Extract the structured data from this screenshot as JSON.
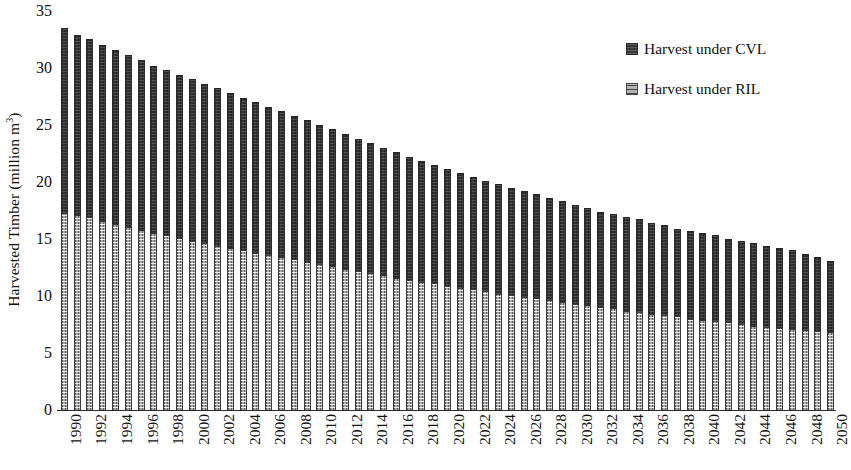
{
  "chart_data": {
    "type": "bar",
    "title": "",
    "subtitle": "",
    "xlabel": "",
    "ylabel": "Harvested Timber (million m³)",
    "ylabel_plain": "Harvested Timber (million m3)",
    "ylim": [
      0,
      35
    ],
    "ytick_step": 5,
    "yticks": [
      0,
      5,
      10,
      15,
      20,
      25,
      30,
      35
    ],
    "grid": false,
    "legend_position": "top-right",
    "bar_style": "overlapping (RIL drawn in front of CVL, same x position)",
    "x": [
      1990,
      1991,
      1992,
      1993,
      1994,
      1995,
      1996,
      1997,
      1998,
      1999,
      2000,
      2001,
      2002,
      2003,
      2004,
      2005,
      2006,
      2007,
      2008,
      2009,
      2010,
      2011,
      2012,
      2013,
      2014,
      2015,
      2016,
      2017,
      2018,
      2019,
      2020,
      2021,
      2022,
      2023,
      2024,
      2025,
      2026,
      2027,
      2028,
      2029,
      2030,
      2031,
      2032,
      2033,
      2034,
      2035,
      2036,
      2037,
      2038,
      2039,
      2040,
      2041,
      2042,
      2043,
      2044,
      2045,
      2046,
      2047,
      2048,
      2049,
      2050
    ],
    "xtick_labels": [
      "1990",
      "1992",
      "1994",
      "1996",
      "1998",
      "2000",
      "2002",
      "2004",
      "2006",
      "2008",
      "2010",
      "2012",
      "2014",
      "2016",
      "2018",
      "2020",
      "2022",
      "2024",
      "2026",
      "2028",
      "2030",
      "2032",
      "2034",
      "2036",
      "2038",
      "2040",
      "2042",
      "2044",
      "2046",
      "2048",
      "2050"
    ],
    "xtick_label_rotation_deg": 90,
    "xtick_label_interval_years": 2,
    "series": [
      {
        "name": "Harvest under CVL",
        "color": "#343434",
        "values": [
          33.6,
          33.0,
          32.6,
          32.1,
          31.7,
          31.2,
          30.8,
          30.3,
          29.9,
          29.5,
          29.1,
          28.7,
          28.3,
          27.9,
          27.5,
          27.1,
          26.7,
          26.3,
          25.9,
          25.5,
          25.1,
          24.7,
          24.3,
          23.9,
          23.5,
          23.1,
          22.7,
          22.3,
          21.9,
          21.6,
          21.2,
          20.9,
          20.5,
          20.2,
          19.9,
          19.6,
          19.3,
          19.0,
          18.7,
          18.4,
          18.1,
          17.8,
          17.5,
          17.3,
          17.0,
          16.8,
          16.5,
          16.3,
          16.0,
          15.8,
          15.6,
          15.4,
          15.1,
          14.9,
          14.7,
          14.5,
          14.3,
          14.1,
          13.8,
          13.5,
          13.2
        ]
      },
      {
        "name": "Harvest under RIL",
        "color": "#a8a8a8",
        "values": [
          17.4,
          17.2,
          17.0,
          16.7,
          16.4,
          16.1,
          15.9,
          15.6,
          15.4,
          15.2,
          14.9,
          14.7,
          14.5,
          14.3,
          14.1,
          13.9,
          13.7,
          13.5,
          13.3,
          13.1,
          12.9,
          12.7,
          12.5,
          12.3,
          12.1,
          11.9,
          11.7,
          11.5,
          11.3,
          11.2,
          11.0,
          10.8,
          10.7,
          10.5,
          10.3,
          10.2,
          10.0,
          9.9,
          9.7,
          9.6,
          9.4,
          9.3,
          9.1,
          9.0,
          8.8,
          8.7,
          8.5,
          8.4,
          8.3,
          8.1,
          8.0,
          7.9,
          7.8,
          7.6,
          7.5,
          7.4,
          7.3,
          7.2,
          7.1,
          7.0,
          6.9
        ]
      }
    ]
  },
  "legend": {
    "items": [
      {
        "label": "Harvest under CVL",
        "swatch": "cvl"
      },
      {
        "label": "Harvest under RIL",
        "swatch": "ril"
      }
    ]
  },
  "colors": {
    "cvl": "#343434",
    "ril": "#a8a8a8",
    "axis": "#2a2a2a",
    "text": "#111111",
    "background": "#ffffff"
  }
}
